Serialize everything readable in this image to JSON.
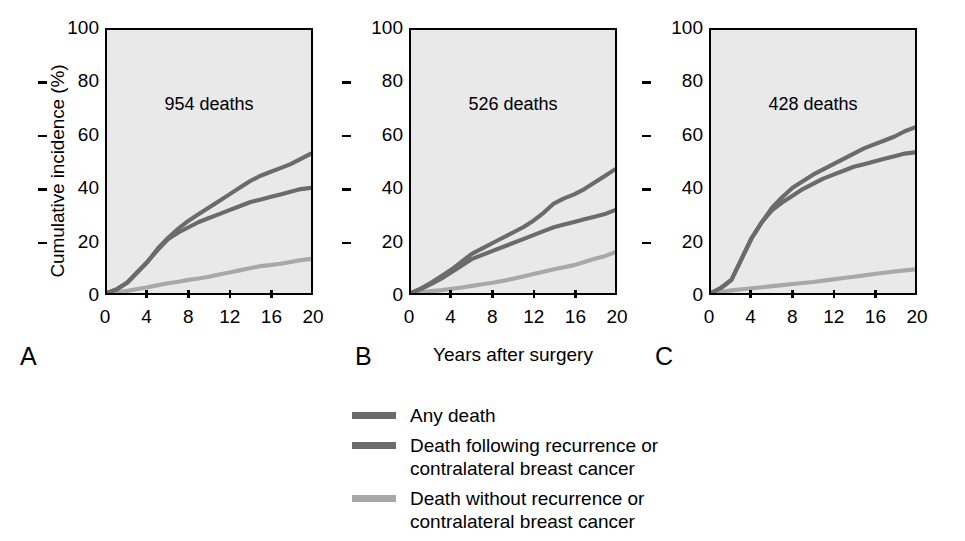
{
  "figure": {
    "y_axis_title": "Cumulative incidence (%)",
    "x_axis_title": "Years after surgery",
    "background": "#e9e9e9",
    "axis_color": "#000000"
  },
  "axes": {
    "y_ticks": [
      "0",
      "20",
      "40",
      "60",
      "80",
      "100"
    ],
    "x_ticks": [
      "0",
      "4",
      "8",
      "12",
      "16",
      "20"
    ],
    "ylim": [
      0,
      100
    ],
    "xlim": [
      0,
      20
    ]
  },
  "panels": [
    {
      "letter": "A",
      "deaths_label": "954 deaths"
    },
    {
      "letter": "B",
      "deaths_label": "526 deaths"
    },
    {
      "letter": "C",
      "deaths_label": "428 deaths"
    }
  ],
  "legend": {
    "items": [
      {
        "label": "Any death",
        "color": "#6b6b6b"
      },
      {
        "label": "Death following recurrence or\ncontralateral breast cancer",
        "color": "#6b6b6b"
      },
      {
        "label": "Death without recurrence or\ncontralateral breast cancer",
        "color": "#a8a8a8"
      }
    ]
  },
  "chart_data": {
    "type": "line",
    "title": "",
    "subtitle": "",
    "xlabel": "Years after surgery",
    "ylabel": "Cumulative incidence (%)",
    "xlim": [
      0,
      20
    ],
    "ylim": [
      0,
      100
    ],
    "xticks": [
      0,
      4,
      8,
      12,
      16,
      20
    ],
    "yticks": [
      0,
      20,
      40,
      60,
      80,
      100
    ],
    "grid": false,
    "legend_position": "below",
    "panels": [
      {
        "panel": "A",
        "annotation": "954 deaths",
        "x": [
          0,
          1,
          2,
          3,
          4,
          5,
          6,
          7,
          8,
          9,
          10,
          11,
          12,
          13,
          14,
          15,
          16,
          17,
          18,
          19,
          20
        ],
        "series": [
          {
            "name": "Any death",
            "color": "#6b6b6b",
            "values": [
              0,
              1.5,
              4,
              8,
              12,
              17,
              21,
              24.5,
              27.5,
              30,
              32.5,
              35,
              37.5,
              40,
              42.5,
              44.5,
              46,
              47.5,
              49,
              51,
              53
            ]
          },
          {
            "name": "Death following recurrence or contralateral breast cancer",
            "color": "#6b6b6b",
            "values": [
              0,
              1.5,
              4,
              8,
              12,
              16.5,
              20.5,
              23,
              25,
              27,
              28.5,
              30,
              31.5,
              33,
              34.5,
              35.5,
              36.5,
              37.5,
              38.5,
              39.5,
              40
            ]
          },
          {
            "name": "Death without recurrence or contralateral breast cancer",
            "color": "#a8a8a8",
            "values": [
              0,
              0.3,
              0.8,
              1.5,
              2.2,
              3,
              3.7,
              4.3,
              5,
              5.5,
              6.2,
              7,
              7.8,
              8.6,
              9.4,
              10.2,
              10.6,
              11.1,
              11.8,
              12.5,
              13
            ]
          }
        ]
      },
      {
        "panel": "B",
        "annotation": "526 deaths",
        "x": [
          0,
          1,
          2,
          3,
          4,
          5,
          6,
          7,
          8,
          9,
          10,
          11,
          12,
          13,
          14,
          15,
          16,
          17,
          18,
          19,
          20
        ],
        "series": [
          {
            "name": "Any death",
            "color": "#6b6b6b",
            "values": [
              0,
              1.8,
              4,
              6.5,
              9,
              12,
              15,
              17,
              19,
              21,
              23,
              25,
              27.5,
              30.5,
              34,
              36,
              37.5,
              39.5,
              42,
              44.5,
              47
            ]
          },
          {
            "name": "Death following recurrence or contralateral breast cancer",
            "color": "#6b6b6b",
            "values": [
              0,
              1.6,
              3.5,
              5.5,
              8,
              10.5,
              13,
              14.5,
              16,
              17.5,
              19,
              20.5,
              22,
              23.5,
              25,
              26,
              27,
              28,
              29,
              30,
              31.5
            ]
          },
          {
            "name": "Death without recurrence or contralateral breast cancer",
            "color": "#a8a8a8",
            "values": [
              0,
              0.3,
              0.7,
              1.1,
              1.6,
              2.1,
              2.7,
              3.3,
              3.9,
              4.6,
              5.4,
              6.3,
              7.2,
              8.1,
              9,
              9.8,
              10.6,
              11.8,
              13,
              14,
              15.5
            ]
          }
        ]
      },
      {
        "panel": "C",
        "annotation": "428 deaths",
        "x": [
          0,
          1,
          2,
          3,
          4,
          5,
          6,
          7,
          8,
          9,
          10,
          11,
          12,
          13,
          14,
          15,
          16,
          17,
          18,
          19,
          20
        ],
        "series": [
          {
            "name": "Any death",
            "color": "#6b6b6b",
            "values": [
              0,
              2,
              5,
              13,
              21,
              27,
              32.5,
              36.5,
              40,
              42.5,
              45,
              47,
              49,
              51,
              53,
              55,
              56.5,
              58,
              59.5,
              61.5,
              63
            ]
          },
          {
            "name": "Death following recurrence or contralateral breast cancer",
            "color": "#6b6b6b",
            "values": [
              0,
              2,
              5,
              13,
              21,
              27,
              31.5,
              34.5,
              37,
              39.5,
              41.5,
              43.5,
              45,
              46.5,
              48,
              49,
              50,
              51,
              52,
              53,
              53.5
            ]
          },
          {
            "name": "Death without recurrence or contralateral breast cancer",
            "color": "#a8a8a8",
            "values": [
              0,
              0.5,
              1,
              1.4,
              1.8,
              2.2,
              2.6,
              3,
              3.4,
              3.8,
              4.2,
              4.7,
              5.2,
              5.7,
              6.2,
              6.7,
              7.2,
              7.7,
              8.2,
              8.6,
              9
            ]
          }
        ]
      }
    ]
  }
}
